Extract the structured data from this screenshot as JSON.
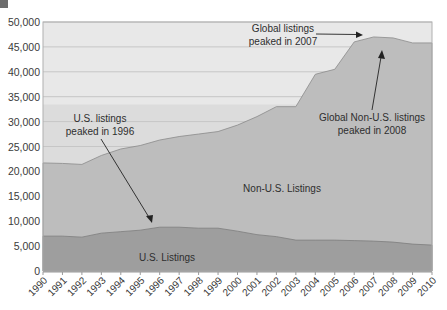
{
  "chart_data": {
    "type": "area",
    "stacked": true,
    "title": "",
    "xlabel": "",
    "ylabel": "",
    "ylim": [
      0,
      50000
    ],
    "y_ticks": [
      0,
      5000,
      10000,
      15000,
      20000,
      25000,
      30000,
      35000,
      40000,
      45000,
      50000
    ],
    "y_tick_labels": [
      "0",
      "5,000",
      "10,000",
      "15,000",
      "20,000",
      "25,000",
      "30,000",
      "35,000",
      "40,000",
      "45,000",
      "50,000"
    ],
    "grid": true,
    "x": [
      "1990",
      "1991",
      "1992",
      "1993",
      "1994",
      "1995",
      "1996",
      "1997",
      "1998",
      "1999",
      "2000",
      "2001",
      "2002",
      "2003",
      "2004",
      "2005",
      "2006",
      "2007",
      "2008",
      "2009",
      "2010"
    ],
    "series": [
      {
        "name": "U.S. Listings",
        "color": "#9e9e9e",
        "values": [
          7000,
          7000,
          6800,
          7600,
          7900,
          8200,
          8800,
          8800,
          8600,
          8600,
          8000,
          7300,
          6900,
          6200,
          6200,
          6200,
          6100,
          6000,
          5800,
          5400,
          5200
        ]
      },
      {
        "name": "Non-U.S. Listings",
        "color": "#bdbdbd",
        "values": [
          14700,
          14600,
          14600,
          15600,
          16600,
          17000,
          17500,
          18200,
          18900,
          19400,
          21300,
          23700,
          26100,
          26800,
          33300,
          34300,
          39900,
          41000,
          41000,
          40400,
          40600
        ]
      }
    ],
    "totals": [
      21700,
      21600,
      21400,
      23200,
      24500,
      25200,
      26300,
      27000,
      27500,
      28000,
      29300,
      31000,
      33000,
      33000,
      39500,
      40500,
      46000,
      47000,
      46800,
      45800,
      45800
    ],
    "annotations": [
      {
        "text": [
          "U.S. listings",
          "peaked in 1996"
        ],
        "points_to": "1996"
      },
      {
        "text": [
          "Global listings",
          "peaked in 2007"
        ],
        "points_to": "2007"
      },
      {
        "text": [
          "Global Non-U.S. listings",
          "peaked in 2008"
        ],
        "points_to": "2008"
      }
    ],
    "area_labels": [
      "Non-U.S. Listings",
      "U.S. Listings"
    ],
    "legend": "none"
  },
  "annotations": {
    "us_peak_line1": "U.S. listings",
    "us_peak_line2": "peaked in 1996",
    "global_peak_line1": "Global listings",
    "global_peak_line2": "peaked in 2007",
    "nonus_peak_line1": "Global Non-U.S. listings",
    "nonus_peak_line2": "peaked in 2008"
  },
  "labels": {
    "non_us": "Non-U.S. Listings",
    "us": "U.S. Listings"
  },
  "colors": {
    "us_area": "#9e9e9e",
    "non_us_area": "#bdbdbd",
    "bg_upper": "#e8e8e8",
    "bg_lower": "#dcdcdc",
    "grid": "#c6c6c6"
  }
}
